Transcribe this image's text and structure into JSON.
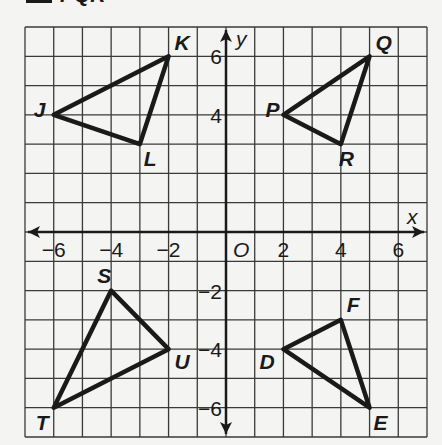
{
  "heading": "PQR",
  "chart_data": {
    "type": "scatter",
    "title": "",
    "xlabel": "x",
    "ylabel": "y",
    "origin_label": "O",
    "xlim": [
      -7,
      7
    ],
    "ylim": [
      -7,
      7
    ],
    "grid": true,
    "x_ticks": [
      -6,
      -4,
      -2,
      2,
      4,
      6
    ],
    "y_ticks": [
      6,
      4,
      -2,
      -4,
      -6
    ],
    "triangles": [
      {
        "name": "JKL",
        "vertices": [
          {
            "label": "J",
            "x": -6,
            "y": 4
          },
          {
            "label": "K",
            "x": -2,
            "y": 6
          },
          {
            "label": "L",
            "x": -3,
            "y": 3
          }
        ]
      },
      {
        "name": "PQR",
        "vertices": [
          {
            "label": "P",
            "x": 2,
            "y": 4
          },
          {
            "label": "Q",
            "x": 5,
            "y": 6
          },
          {
            "label": "R",
            "x": 4,
            "y": 3
          }
        ]
      },
      {
        "name": "STU",
        "vertices": [
          {
            "label": "S",
            "x": -4,
            "y": -2
          },
          {
            "label": "T",
            "x": -6,
            "y": -6
          },
          {
            "label": "U",
            "x": -2,
            "y": -4
          }
        ]
      },
      {
        "name": "DEF",
        "vertices": [
          {
            "label": "D",
            "x": 2,
            "y": -4
          },
          {
            "label": "E",
            "x": 5,
            "y": -6
          },
          {
            "label": "F",
            "x": 4,
            "y": -3
          }
        ]
      }
    ]
  },
  "colors": {
    "ink": "#1a1a1a",
    "grid": "#3a3a3a",
    "paper": "#f4f4f2"
  }
}
